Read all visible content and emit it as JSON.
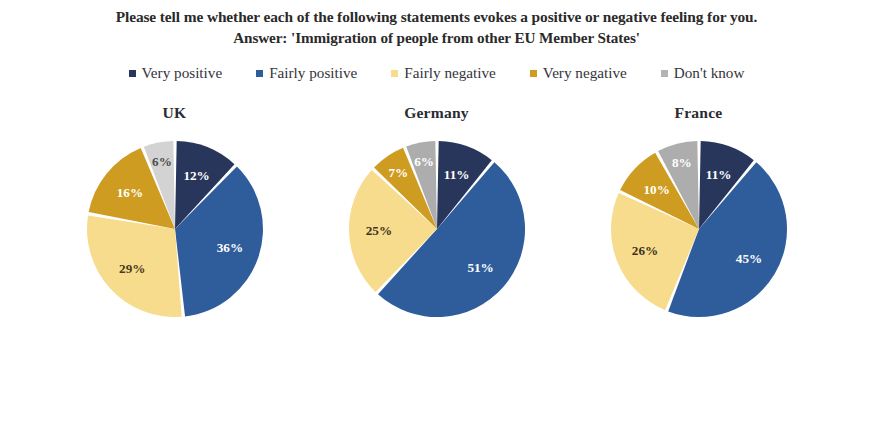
{
  "title": {
    "line1": "Please tell me whether each of the following statements evokes a positive or negative feeling for you.",
    "line2": "Answer: 'Immigration of people from other EU Member States'"
  },
  "legend": {
    "items": [
      {
        "label": "Very positive",
        "color": "#28365c",
        "swatch_name": "legend-swatch-very-positive"
      },
      {
        "label": "Fairly positive",
        "color": "#2f5d9b",
        "swatch_name": "legend-swatch-fairly-positive"
      },
      {
        "label": "Fairly negative",
        "color": "#f7dc8e",
        "swatch_name": "legend-swatch-fairly-negative"
      },
      {
        "label": "Very negative",
        "color": "#cf9c22",
        "swatch_name": "legend-swatch-very-negative"
      },
      {
        "label": "Don't know",
        "color": "#b3b3b3",
        "swatch_name": "legend-swatch-dont-know"
      }
    ]
  },
  "charts": [
    {
      "caption": "UK"
    },
    {
      "caption": "Germany"
    },
    {
      "caption": "France"
    }
  ],
  "chart_data": [
    {
      "type": "pie",
      "title": "UK",
      "labels": [
        "Very positive",
        "Fairly positive",
        "Fairly negative",
        "Very negative",
        "Don't know"
      ],
      "values": [
        12,
        36,
        29,
        16,
        6
      ],
      "value_labels": [
        "12%",
        "36%",
        "29%",
        "16%",
        "6%"
      ],
      "colors": [
        "#28365c",
        "#2f5d9b",
        "#f7dc8e",
        "#cf9c22",
        "#d3d3d3"
      ],
      "label_colors": [
        "#ffffff",
        "#ffffff",
        "#4a3a1a",
        "#ffffff",
        "#4d4d4d"
      ],
      "unit": "%",
      "start_angle_deg": 0,
      "direction": "clockwise",
      "legend_position": "top"
    },
    {
      "type": "pie",
      "title": "Germany",
      "labels": [
        "Very positive",
        "Fairly positive",
        "Fairly negative",
        "Very negative",
        "Don't know"
      ],
      "values": [
        11,
        51,
        25,
        7,
        6
      ],
      "value_labels": [
        "11%",
        "51%",
        "25%",
        "7%",
        "6%"
      ],
      "colors": [
        "#28365c",
        "#2f5d9b",
        "#f7dc8e",
        "#cf9c22",
        "#adadad"
      ],
      "label_colors": [
        "#ffffff",
        "#ffffff",
        "#3d3220",
        "#ffffff",
        "#ffffff"
      ],
      "unit": "%",
      "start_angle_deg": 0,
      "direction": "clockwise",
      "legend_position": "top"
    },
    {
      "type": "pie",
      "title": "France",
      "labels": [
        "Very positive",
        "Fairly positive",
        "Fairly negative",
        "Very negative",
        "Don't know"
      ],
      "values": [
        11,
        45,
        26,
        10,
        8
      ],
      "value_labels": [
        "11%",
        "45%",
        "26%",
        "10%",
        "8%"
      ],
      "colors": [
        "#28365c",
        "#2f5d9b",
        "#f7dc8e",
        "#cf9c22",
        "#adadad"
      ],
      "label_colors": [
        "#ffffff",
        "#ffffff",
        "#3d3220",
        "#ffffff",
        "#ffffff"
      ],
      "unit": "%",
      "start_angle_deg": 0,
      "direction": "clockwise",
      "legend_position": "top"
    }
  ]
}
